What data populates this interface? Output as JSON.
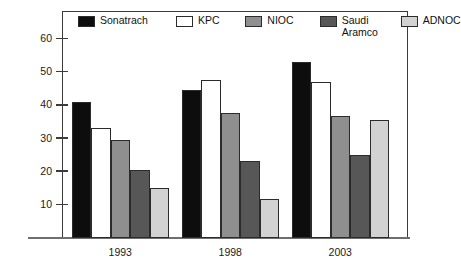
{
  "figure": {
    "clipped_header_text": "",
    "background_color": "#ffffff",
    "frame_color": "#3b3b3b"
  },
  "legend": {
    "position": "top-inside",
    "entries": [
      {
        "label": "Sonatrach",
        "color": "#0d0d0d"
      },
      {
        "label": "KPC",
        "color": "#ffffff"
      },
      {
        "label": "NIOC",
        "color": "#8f8f8f"
      },
      {
        "label": "Saudi\nAramco",
        "color": "#575757"
      },
      {
        "label": "ADNOC",
        "color": "#d2d2d2"
      }
    ]
  },
  "axes": {
    "y_ticks": [
      10,
      20,
      30,
      40,
      50,
      60
    ],
    "y_tick_labels": [
      "10",
      "20",
      "30",
      "40",
      "50",
      "60"
    ],
    "x_tick_labels": [
      "1993",
      "1998",
      "2003"
    ]
  },
  "chart_data": {
    "type": "bar",
    "title": "",
    "xlabel": "",
    "ylabel": "",
    "ylim": [
      0,
      68
    ],
    "grid": false,
    "legend_position": "top-inside",
    "categories": [
      "1993",
      "1998",
      "2003"
    ],
    "series": [
      {
        "name": "Sonatrach",
        "color": "#0d0d0d",
        "values": [
          41,
          44.5,
          53
        ]
      },
      {
        "name": "KPC",
        "color": "#ffffff",
        "values": [
          33,
          47.5,
          47
        ]
      },
      {
        "name": "NIOC",
        "color": "#8f8f8f",
        "values": [
          29.5,
          37.5,
          36.5
        ]
      },
      {
        "name": "Saudi Aramco",
        "color": "#575757",
        "values": [
          20.5,
          23,
          25
        ]
      },
      {
        "name": "ADNOC",
        "color": "#d2d2d2",
        "values": [
          15,
          11.5,
          35.5
        ]
      }
    ]
  }
}
